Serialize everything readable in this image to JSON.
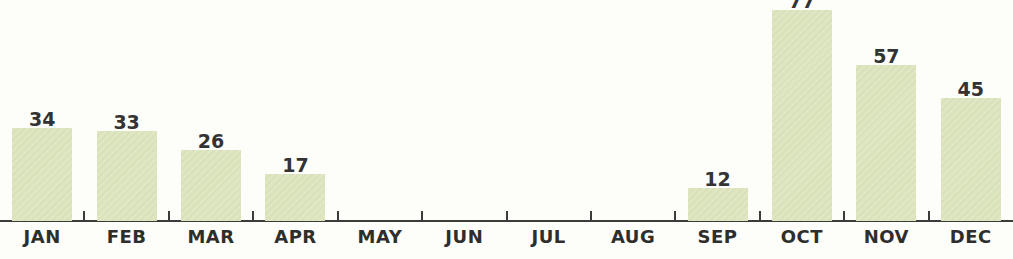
{
  "chart_data": {
    "type": "bar",
    "title": "",
    "xlabel": "",
    "ylabel": "",
    "categories": [
      "JAN",
      "FEB",
      "MAR",
      "APR",
      "MAY",
      "JUN",
      "JUL",
      "AUG",
      "SEP",
      "OCT",
      "NOV",
      "DEC"
    ],
    "values": [
      34,
      33,
      26,
      17,
      0,
      0,
      0,
      0,
      12,
      77,
      57,
      45
    ],
    "value_labels": [
      "34",
      "33",
      "26",
      "17",
      "",
      "",
      "",
      "",
      "12",
      "77",
      "57",
      "45"
    ],
    "ylim": [
      0,
      80
    ],
    "grid": false,
    "legend": false,
    "annotations": "OCT value label 77 is clipped by the top edge of the image; MAY-AUG have zero-height bars with no labels",
    "colors": {
      "bar_fill": "#dee6c2",
      "bar_texture": "#d9e1ba",
      "axis": "#3b3b39",
      "value_label_text": "#333333",
      "month_label_text": "#2e2e2c",
      "background": "#fdfdfa"
    }
  }
}
